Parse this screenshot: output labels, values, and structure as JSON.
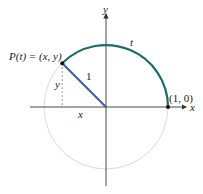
{
  "diagram": {
    "colors": {
      "axis": "#333333",
      "circle": "#cfcfcf",
      "arc": "#1f6b6b",
      "radius": "#3a5f9a",
      "dashed": "#888888",
      "point": "#111111"
    },
    "labels": {
      "y_axis": "y",
      "x_axis": "x",
      "arc_length": "t",
      "point_p": "P(t) = (x, y)",
      "radius": "1",
      "y_leg": "y",
      "x_leg": "x",
      "point_one_zero": "(1, 0)"
    }
  }
}
